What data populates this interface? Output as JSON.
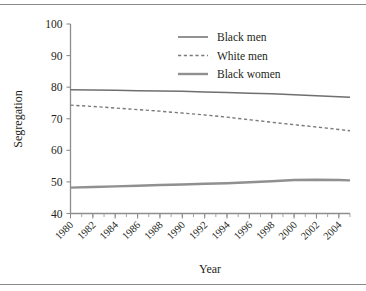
{
  "chart_data": {
    "type": "line",
    "title": "",
    "xlabel": "Year",
    "ylabel": "Segregation",
    "xlim": [
      1980,
      2005
    ],
    "ylim": [
      40,
      100
    ],
    "yticks": [
      40,
      50,
      60,
      70,
      80,
      90,
      100
    ],
    "xticks": [
      1980,
      1982,
      1984,
      1986,
      1988,
      1990,
      1992,
      1994,
      1996,
      1998,
      2000,
      2002,
      2004
    ],
    "xticks_minor_step": 1,
    "grid": false,
    "legend_position": "upper-right",
    "x": [
      1980,
      1982,
      1984,
      1986,
      1988,
      1990,
      1992,
      1994,
      1996,
      1998,
      2000,
      2002,
      2004,
      2005
    ],
    "series": [
      {
        "name": "Black men",
        "style": "solid",
        "color": "#6f6f6f",
        "values": [
          79.2,
          79.1,
          79.0,
          78.9,
          78.8,
          78.7,
          78.5,
          78.3,
          78.1,
          77.9,
          77.6,
          77.3,
          77.0,
          76.8
        ]
      },
      {
        "name": "White men",
        "style": "dashed",
        "color": "#7a7a7a",
        "values": [
          74.3,
          73.9,
          73.4,
          72.9,
          72.4,
          71.8,
          71.2,
          70.5,
          69.7,
          68.9,
          68.1,
          67.4,
          66.6,
          66.2
        ]
      },
      {
        "name": "Black women",
        "style": "solid-thick",
        "color": "#909090",
        "values": [
          48.2,
          48.4,
          48.6,
          48.8,
          49.0,
          49.2,
          49.4,
          49.6,
          49.9,
          50.2,
          50.6,
          50.7,
          50.6,
          50.5
        ]
      }
    ]
  },
  "axes": {
    "ylabel": "Segregation",
    "xlabel": "Year",
    "ytick_labels": [
      "100",
      "90",
      "80",
      "70",
      "60",
      "50",
      "40"
    ],
    "xtick_labels": [
      "1980",
      "1982",
      "1984",
      "1986",
      "1988",
      "1990",
      "1992",
      "1994",
      "1996",
      "1998",
      "2000",
      "2002",
      "2004"
    ]
  },
  "legend": {
    "entries": [
      {
        "label": "Black men"
      },
      {
        "label": "White men"
      },
      {
        "label": "Black women"
      }
    ]
  }
}
